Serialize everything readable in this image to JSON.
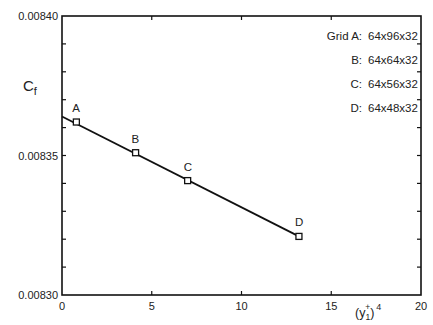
{
  "chart_data": {
    "type": "line",
    "title": "",
    "xlabel": "(y1+)^4",
    "ylabel": "Cf",
    "xlim": [
      0,
      20
    ],
    "ylim": [
      0.0083,
      0.0084
    ],
    "x_ticks": [
      0,
      5,
      10,
      15,
      20
    ],
    "x_tick_labels": [
      "0",
      "5",
      "10",
      "15",
      "20"
    ],
    "y_ticks": [
      0.0083,
      0.00835,
      0.0084
    ],
    "y_tick_labels": [
      "0.00830",
      "0.00835",
      "0.00840"
    ],
    "y_minor_tick_step": 1e-05,
    "grid": false,
    "series": [
      {
        "name": "Cf vs (y1+)^4",
        "marker": "square",
        "points": [
          {
            "label": "A",
            "x": 0.8,
            "y": 0.008362
          },
          {
            "label": "B",
            "x": 4.1,
            "y": 0.008351
          },
          {
            "label": "C",
            "x": 7.0,
            "y": 0.008341
          },
          {
            "label": "D",
            "x": 13.2,
            "y": 0.008321
          }
        ],
        "fit_line": {
          "x_start": 0,
          "y_start": 0.008364,
          "x_end": 13.2,
          "y_end": 0.008321
        }
      }
    ],
    "legend": {
      "position": "upper right",
      "entries": [
        {
          "key": "Grid A:",
          "value": "64x96x32"
        },
        {
          "key": "B:",
          "value": "64x64x32"
        },
        {
          "key": "C:",
          "value": "64x56x32"
        },
        {
          "key": "D:",
          "value": "64x48x32"
        }
      ]
    }
  },
  "labels": {
    "ylabel_main": "C",
    "ylabel_sub": "f",
    "xlabel_base": "(y",
    "xlabel_sub": "1",
    "xlabel_sup_plus": "+",
    "xlabel_close": ")",
    "xlabel_exp": "4"
  }
}
